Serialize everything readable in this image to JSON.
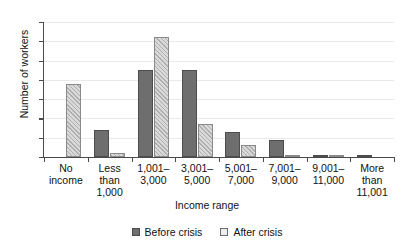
{
  "chart_data": {
    "type": "bar",
    "title": "",
    "xlabel": "Income range",
    "ylabel": "Number of workers",
    "ylim": [
      0,
      70
    ],
    "yticks": [
      0,
      10,
      20,
      30,
      40,
      50,
      60,
      70
    ],
    "grid": true,
    "legend_position": "bottom",
    "categories": [
      "No income",
      "Less than 1,000",
      "1,001–3,000",
      "3,001–5,000",
      "5,001–7,000",
      "7,001–9,000",
      "9,001–11,000",
      "More than 11,001"
    ],
    "category_lines": [
      [
        "No",
        "income"
      ],
      [
        "Less",
        "than",
        "1,000"
      ],
      [
        "1,001–",
        "3,000"
      ],
      [
        "3,001–",
        "5,000"
      ],
      [
        "5,001–",
        "7,000"
      ],
      [
        "7,001–",
        "9,000"
      ],
      [
        "9,001–",
        "11,000"
      ],
      [
        "More",
        "than",
        "11,001"
      ]
    ],
    "series": [
      {
        "name": "Before crisis",
        "color": "#6e6e6e",
        "values": [
          0,
          14,
          45,
          45,
          13,
          9,
          1,
          1
        ]
      },
      {
        "name": "After crisis",
        "color": "#d9d9d9",
        "values": [
          38,
          2,
          62,
          17,
          6,
          1,
          1,
          0
        ]
      }
    ]
  },
  "legend": {
    "items": [
      {
        "label": "Before crisis"
      },
      {
        "label": "After crisis"
      }
    ]
  }
}
